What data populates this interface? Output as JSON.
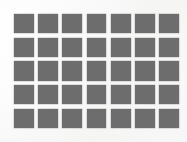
{
  "image": {
    "title": "Grid of gray squares",
    "width": 187,
    "height": 142,
    "background_color": "#fbfbfb",
    "medium": "scanned print"
  },
  "grid": {
    "name": "square-grid",
    "columns": 7,
    "rows": 5,
    "cell_count": 35,
    "square_color": "#6d6d6d",
    "square_size_px": 19,
    "column_gap_px": 4.7,
    "row_gap_px": 4.6,
    "offset_left_px": 14,
    "offset_top_px": 14,
    "block_width_px": 165,
    "block_height_px": 114,
    "cells": [
      [
        1,
        1,
        1,
        1,
        1,
        1,
        1
      ],
      [
        1,
        1,
        1,
        1,
        1,
        1,
        1
      ],
      [
        1,
        1,
        1,
        1,
        1,
        1,
        1
      ],
      [
        1,
        1,
        1,
        1,
        1,
        1,
        1
      ],
      [
        1,
        1,
        1,
        1,
        1,
        1,
        1
      ]
    ]
  }
}
